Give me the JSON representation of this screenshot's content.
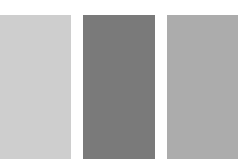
{
  "swatches": [
    {
      "name": "light-gray",
      "color": "#cecece",
      "x": 0,
      "width": 71
    },
    {
      "name": "dark-gray",
      "color": "#7a7a7a",
      "x": 83,
      "width": 72
    },
    {
      "name": "medium-gray",
      "color": "#acacac",
      "x": 167,
      "width": 71
    }
  ]
}
